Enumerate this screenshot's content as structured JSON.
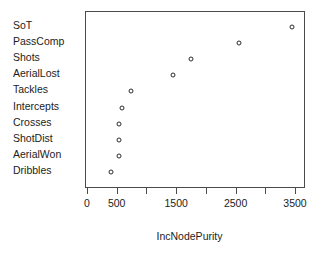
{
  "chart_data": {
    "type": "scatter",
    "orientation": "horizontal",
    "title": "",
    "xlabel": "IncNodePurity",
    "ylabel": "",
    "xlim": [
      0,
      3600
    ],
    "xticks": [
      0,
      500,
      1000,
      1500,
      2000,
      2500,
      3000,
      3500
    ],
    "xticklabels": [
      "0",
      "500",
      "",
      "1500",
      "",
      "2500",
      "",
      "3500"
    ],
    "grid": false,
    "legend": null,
    "marker": "open-circle",
    "categories": [
      "SoT",
      "PassComp",
      "Shots",
      "AerialLost",
      "Tackles",
      "Intercepts",
      "Crosses",
      "ShotDist",
      "AerialWon",
      "Dribbles"
    ],
    "values": [
      3440,
      2540,
      1735,
      1430,
      725,
      575,
      525,
      520,
      515,
      385
    ],
    "points": [
      {
        "label": "SoT",
        "value": 3440
      },
      {
        "label": "PassComp",
        "value": 2540
      },
      {
        "label": "Shots",
        "value": 1735
      },
      {
        "label": "AerialLost",
        "value": 1430
      },
      {
        "label": "Tackles",
        "value": 725
      },
      {
        "label": "Intercepts",
        "value": 575
      },
      {
        "label": "Crosses",
        "value": 525
      },
      {
        "label": "ShotDist",
        "value": 520
      },
      {
        "label": "AerialWon",
        "value": 515
      },
      {
        "label": "Dribbles",
        "value": 385
      }
    ],
    "colors": {
      "marker_stroke": "#2b2b2b",
      "marker_fill": "#ffffff",
      "axis": "#4a4a4a",
      "text": "#1c1c1c",
      "background": "#ffffff"
    }
  }
}
